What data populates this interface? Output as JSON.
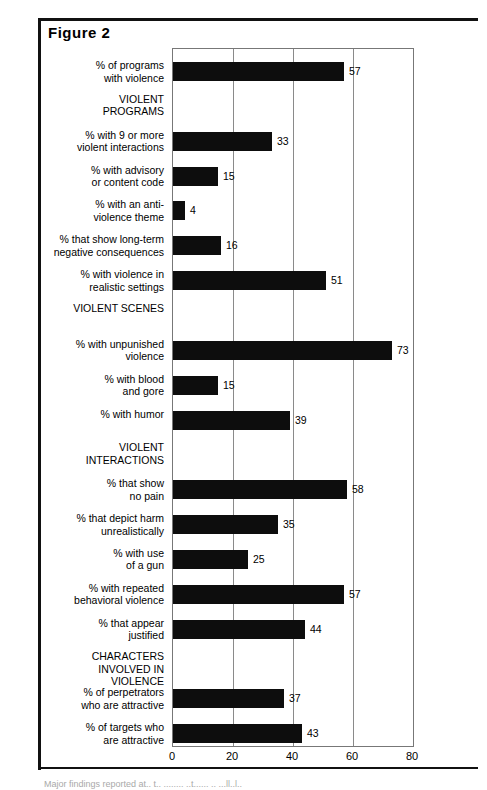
{
  "figure": {
    "title": "Figure 2",
    "footnote_fragment": "Major findings reported at.. t.. ........ ..t...... .. ...ll..l.."
  },
  "axis": {
    "ticks": [
      0,
      20,
      40,
      60,
      80
    ],
    "min": 0,
    "max": 80,
    "tick_labels": [
      "0",
      "20",
      "40",
      "60",
      "80"
    ]
  },
  "chart_data": {
    "type": "bar",
    "orientation": "horizontal",
    "title": "Figure 2",
    "xlabel": "",
    "ylabel": "",
    "xlim": [
      0,
      80
    ],
    "grid": true,
    "legend": "none",
    "categories": [
      "% of programs with violence",
      "% with 9 or more violent interactions",
      "% with advisory or content code",
      "% with an anti-violence theme",
      "% that show long-term negative consequences",
      "% with violence in realistic settings",
      "% with unpunished violence",
      "% with blood and gore",
      "% with humor",
      "% that show no pain",
      "% that depict harm unrealistically",
      "% with use of a gun",
      "% with repeated behavioral violence",
      "% that appear justified",
      "% of perpetrators who are attractive",
      "% of targets who are attractive"
    ],
    "values": [
      57,
      33,
      15,
      4,
      16,
      51,
      73,
      15,
      39,
      58,
      35,
      25,
      57,
      44,
      37,
      43
    ],
    "group_headers": [
      "VIOLENT PROGRAMS",
      "VIOLENT SCENES",
      "VIOLENT INTERACTIONS",
      "CHARACTERS INVOLVED IN VIOLENCE"
    ],
    "rows": [
      {
        "kind": "bar",
        "label": "% of programs\nwith violence",
        "value": 57
      },
      {
        "kind": "group",
        "label": "VIOLENT\nPROGRAMS",
        "value": null
      },
      {
        "kind": "bar",
        "label": "% with 9 or more\nviolent interactions",
        "value": 33
      },
      {
        "kind": "bar",
        "label": "% with advisory\nor content code",
        "value": 15
      },
      {
        "kind": "bar",
        "label": "% with an anti-\nviolence theme",
        "value": 4
      },
      {
        "kind": "bar",
        "label": "% that show long-term\nnegative consequences",
        "value": 16
      },
      {
        "kind": "bar",
        "label": "% with violence in\nrealistic settings",
        "value": 51
      },
      {
        "kind": "group",
        "label": "VIOLENT SCENES",
        "value": null
      },
      {
        "kind": "bar",
        "label": "% with unpunished\nviolence",
        "value": 73
      },
      {
        "kind": "bar",
        "label": "% with blood\nand gore",
        "value": 15
      },
      {
        "kind": "bar",
        "label": "% with humor",
        "value": 39
      },
      {
        "kind": "group",
        "label": "VIOLENT\nINTERACTIONS",
        "value": null
      },
      {
        "kind": "bar",
        "label": "% that show\nno pain",
        "value": 58
      },
      {
        "kind": "bar",
        "label": "% that depict harm\nunrealistically",
        "value": 35
      },
      {
        "kind": "bar",
        "label": "% with use\nof a gun",
        "value": 25
      },
      {
        "kind": "bar",
        "label": "% with repeated\nbehavioral violence",
        "value": 57
      },
      {
        "kind": "bar",
        "label": "% that appear\njustified",
        "value": 44
      },
      {
        "kind": "group",
        "label": "CHARACTERS\nINVOLVED IN\nVIOLENCE",
        "value": null
      },
      {
        "kind": "bar",
        "label": "% of perpetrators\nwho are attractive",
        "value": 37
      },
      {
        "kind": "bar",
        "label": "% of targets who\nare attractive",
        "value": 43
      }
    ]
  },
  "colors": {
    "bar": "#0d0d0d",
    "grid": "#8a8a8a",
    "frame": "#111111",
    "text": "#000000"
  }
}
